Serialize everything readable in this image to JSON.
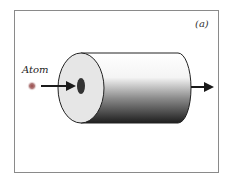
{
  "figure": {
    "panel_label": "(a)",
    "atom_label": "Atom",
    "colors": {
      "frame": "#8a8a8a",
      "face": "#e6e6e6",
      "body_top": "#ffffff",
      "body_bottom": "#222222",
      "arrow": "#1a1a1a",
      "hole": "#333333"
    }
  }
}
